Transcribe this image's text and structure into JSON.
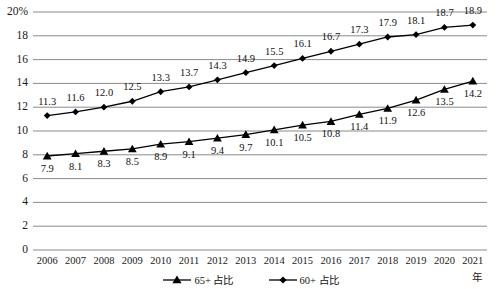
{
  "chart_data": {
    "type": "line",
    "title": "",
    "subtitle": "",
    "xlabel": "年",
    "ylabel": "",
    "categories": [
      "2006",
      "2007",
      "2008",
      "2009",
      "2010",
      "2011",
      "2012",
      "2013",
      "2014",
      "2015",
      "2016",
      "2017",
      "2018",
      "2019",
      "2020",
      "2021"
    ],
    "ylim": [
      0,
      20
    ],
    "ytick_labels": [
      "0",
      "2",
      "4",
      "6",
      "8",
      "10",
      "12",
      "14",
      "16",
      "18",
      "20%"
    ],
    "ytick_values": [
      0,
      2,
      4,
      6,
      8,
      10,
      12,
      14,
      16,
      18,
      20
    ],
    "grid": true,
    "legend_position": "bottom",
    "series": [
      {
        "name": "65+ 占比",
        "marker": "triangle",
        "color": "#000000",
        "values": [
          7.9,
          8.1,
          8.3,
          8.5,
          8.9,
          9.1,
          9.4,
          9.7,
          10.1,
          10.5,
          10.8,
          11.4,
          11.9,
          12.6,
          13.5,
          14.2
        ],
        "labels": [
          "7.9",
          "8.1",
          "8.3",
          "8.5",
          "8.9",
          "9.1",
          "9.4",
          "9.7",
          "10.1",
          "10.5",
          "10.8",
          "11.4",
          "11.9",
          "12.6",
          "13.5",
          "14.2"
        ],
        "label_position": "below"
      },
      {
        "name": "60+ 占比",
        "marker": "diamond",
        "color": "#000000",
        "values": [
          11.3,
          11.6,
          12.0,
          12.5,
          13.3,
          13.7,
          14.3,
          14.9,
          15.5,
          16.1,
          16.7,
          17.3,
          17.9,
          18.1,
          18.7,
          18.9
        ],
        "labels": [
          "11.3",
          "11.6",
          "12.0",
          "12.5",
          "13.3",
          "13.7",
          "14.3",
          "14.9",
          "15.5",
          "16.1",
          "16.7",
          "17.3",
          "17.9",
          "18.1",
          "18.7",
          "18.9"
        ],
        "label_position": "above"
      }
    ]
  },
  "axis": {
    "x_unit_label": "年"
  }
}
